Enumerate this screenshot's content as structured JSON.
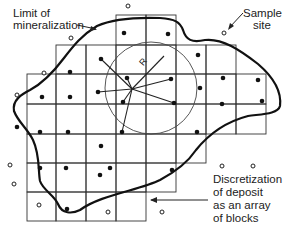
{
  "diagram": {
    "labels": {
      "limit_line1": "Limit of",
      "limit_line2": "mineralization",
      "sample_line1": "Sample",
      "sample_line2": "site",
      "discret_line1": "Discretization",
      "discret_line2": "of deposit",
      "discret_line3": "as an array",
      "discret_line4": "of blocks",
      "radius": "R"
    },
    "colors": {
      "ink": "#222222",
      "background": "#ffffff"
    },
    "grid": {
      "block_size_px": 30,
      "rows": [
        {
          "y": 15,
          "x_from": 116,
          "x_to": 176
        },
        {
          "y": 45,
          "x_from": 56,
          "x_to": 236
        },
        {
          "y": 74,
          "x_from": 27,
          "x_to": 266
        },
        {
          "y": 104,
          "x_from": 27,
          "x_to": 266
        },
        {
          "y": 134,
          "x_from": 27,
          "x_to": 266
        },
        {
          "y": 163,
          "x_from": 27,
          "x_to": 236
        },
        {
          "y": 192,
          "x_from": 27,
          "x_to": 146
        }
      ]
    },
    "search_circle": {
      "cx": 150,
      "cy": 88,
      "r": 46
    },
    "samples_inside": 27,
    "samples_outside": 12
  }
}
